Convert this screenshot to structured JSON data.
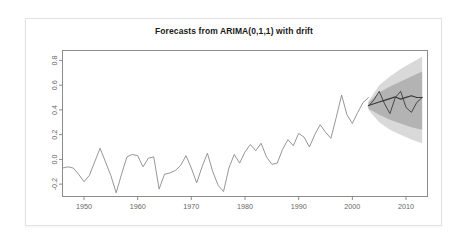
{
  "chart_data": {
    "type": "line",
    "title": "Forecasts from ARIMA(0,1,1) with drift",
    "xlabel": "",
    "ylabel": "",
    "xlim": [
      1946,
      2014
    ],
    "ylim": [
      -0.3,
      0.88
    ],
    "grid": false,
    "legend": null,
    "xticks": [
      1950,
      1960,
      1970,
      1980,
      1990,
      2000,
      2010
    ],
    "xtick_labels": [
      "1950",
      "1960",
      "1970",
      "1980",
      "1990",
      "2000",
      "2010"
    ],
    "yticks": [
      -0.2,
      0.0,
      0.2,
      0.4,
      0.6,
      0.8
    ],
    "ytick_labels": [
      "-0.2",
      "0.0",
      "0.2",
      "0.4",
      "0.6",
      "0.8"
    ],
    "colors": {
      "history_line": "#8a8a8a",
      "forecast_line": "#3a3a3a",
      "pi_80": "#b3b3b3",
      "pi_95": "#d9d9d9",
      "axis": "#8c8c8c",
      "title": "#1a1a1a",
      "tick_text": "#666666",
      "card_border": "#e3e3e3",
      "background": "#ffffff"
    },
    "series": [
      {
        "name": "Observed",
        "type": "line",
        "x": [
          1946,
          1947,
          1948,
          1949,
          1950,
          1951,
          1952,
          1953,
          1954,
          1955,
          1956,
          1957,
          1958,
          1959,
          1960,
          1961,
          1962,
          1963,
          1964,
          1965,
          1966,
          1967,
          1968,
          1969,
          1970,
          1971,
          1972,
          1973,
          1974,
          1975,
          1976,
          1977,
          1978,
          1979,
          1980,
          1981,
          1982,
          1983,
          1984,
          1985,
          1986,
          1987,
          1988,
          1989,
          1990,
          1991,
          1992,
          1993,
          1994,
          1995,
          1996,
          1997,
          1998,
          1999,
          2000,
          2001,
          2002,
          2003
        ],
        "values": [
          -0.07,
          -0.06,
          -0.07,
          -0.12,
          -0.18,
          -0.13,
          -0.02,
          0.09,
          -0.02,
          -0.13,
          -0.27,
          -0.12,
          0.02,
          0.04,
          0.03,
          -0.06,
          0.01,
          0.02,
          -0.24,
          -0.12,
          -0.11,
          -0.09,
          -0.05,
          0.03,
          -0.07,
          -0.19,
          -0.06,
          0.05,
          -0.1,
          -0.21,
          -0.26,
          -0.07,
          0.04,
          -0.03,
          0.06,
          0.12,
          0.07,
          0.13,
          0.02,
          -0.04,
          -0.03,
          0.08,
          0.16,
          0.11,
          0.21,
          0.18,
          0.1,
          0.2,
          0.28,
          0.22,
          0.17,
          0.34,
          0.52,
          0.36,
          0.29,
          0.38,
          0.46,
          0.5
        ]
      },
      {
        "name": "Point forecast",
        "type": "line",
        "x": [
          2003,
          2004,
          2005,
          2006,
          2007,
          2008,
          2009,
          2010,
          2011,
          2012,
          2013
        ],
        "values": [
          0.435,
          0.449,
          0.463,
          0.477,
          0.491,
          0.505,
          0.487,
          0.501,
          0.515,
          0.5,
          0.5
        ]
      },
      {
        "name": "Forecast path (seasonal zigzag)",
        "type": "line",
        "x": [
          2003,
          2004,
          2005,
          2006,
          2007,
          2008,
          2009,
          2010,
          2011,
          2012,
          2013
        ],
        "values": [
          0.43,
          0.48,
          0.55,
          0.45,
          0.37,
          0.5,
          0.55,
          0.42,
          0.38,
          0.46,
          0.5
        ]
      }
    ],
    "prediction_intervals": [
      {
        "level": 95,
        "x": [
          2003,
          2005,
          2007,
          2009,
          2011,
          2013
        ],
        "lower": [
          0.4,
          0.3,
          0.24,
          0.2,
          0.16,
          0.13
        ],
        "upper": [
          0.47,
          0.6,
          0.67,
          0.73,
          0.78,
          0.83
        ],
        "fill": "#d9d9d9"
      },
      {
        "level": 80,
        "x": [
          2003,
          2005,
          2007,
          2009,
          2011,
          2013
        ],
        "lower": [
          0.41,
          0.36,
          0.32,
          0.29,
          0.26,
          0.24
        ],
        "upper": [
          0.46,
          0.54,
          0.59,
          0.63,
          0.67,
          0.71
        ],
        "fill": "#b3b3b3"
      }
    ]
  },
  "page": {
    "window_title": "Forecasts from ARIMA(0,1,1) with drift"
  }
}
